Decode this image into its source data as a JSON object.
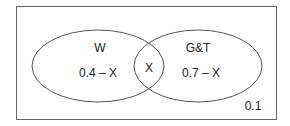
{
  "diagram": {
    "type": "venn",
    "universe": {
      "outside_value": "0.1"
    },
    "sets": [
      {
        "name": "W",
        "label": "W",
        "only_value": "0.4 – X"
      },
      {
        "name": "G&T",
        "label": "G&T",
        "only_value": "0.7 – X"
      }
    ],
    "intersection": {
      "value": "X"
    },
    "colors": {
      "stroke": "#555555",
      "background": "#ffffff",
      "text": "#222222"
    }
  }
}
